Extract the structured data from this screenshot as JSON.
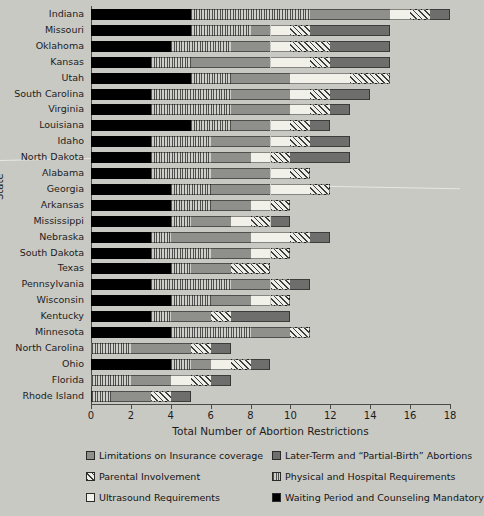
{
  "chart_data": {
    "type": "bar",
    "orientation": "horizontal",
    "stacked": true,
    "title": "",
    "xlabel": "Total Number of Abortion Restrictions",
    "ylabel": "State",
    "xlim": [
      0,
      18
    ],
    "xticks": [
      0,
      2,
      4,
      6,
      8,
      10,
      12,
      14,
      16,
      18
    ],
    "grid": false,
    "legend_position": "bottom",
    "series": [
      {
        "name": "Waiting Period and Counseling Mandatory",
        "key": "wait",
        "pattern": "solid-black",
        "color": "#000000"
      },
      {
        "name": "Physical and Hospital Requirements",
        "key": "physical",
        "pattern": "vertical-stripes",
        "color": "#b6b6b2"
      },
      {
        "name": "Limitations on Insurance coverage",
        "key": "insurance",
        "pattern": "solid-gray",
        "color": "#8f8f8b"
      },
      {
        "name": "Ultrasound Requirements",
        "key": "ultrasound",
        "pattern": "solid-white",
        "color": "#f1f1ea"
      },
      {
        "name": "Parental Involvement",
        "key": "parental",
        "pattern": "diagonal-hatch",
        "color": "#e8e8e1"
      },
      {
        "name": "Later-Term and \"Partial-Birth\" Abortions",
        "key": "later",
        "pattern": "solid-darkgray",
        "color": "#6e6e6c"
      }
    ],
    "categories": [
      "Indiana",
      "Missouri",
      "Oklahoma",
      "Kansas",
      "Utah",
      "South Carolina",
      "Virginia",
      "Louisiana",
      "Idaho",
      "North Dakota",
      "Alabama",
      "Georgia",
      "Arkansas",
      "Mississippi",
      "Nebraska",
      "South Dakota",
      "Texas",
      "Pennsylvania",
      "Wisconsin",
      "Kentucky",
      "Minnesota",
      "North Carolina",
      "Ohio",
      "Florida",
      "Rhode Island"
    ],
    "rows": [
      {
        "state": "Indiana",
        "wait": 5,
        "physical": 6,
        "insurance": 4,
        "ultrasound": 1,
        "parental": 1,
        "later": 1,
        "total": 18
      },
      {
        "state": "Missouri",
        "wait": 5,
        "physical": 3,
        "insurance": 1,
        "ultrasound": 1,
        "parental": 1,
        "later": 4,
        "total": 15
      },
      {
        "state": "Oklahoma",
        "wait": 4,
        "physical": 3,
        "insurance": 2,
        "ultrasound": 1,
        "parental": 2,
        "later": 3,
        "total": 15
      },
      {
        "state": "Kansas",
        "wait": 3,
        "physical": 2,
        "insurance": 4,
        "ultrasound": 2,
        "parental": 1,
        "later": 3,
        "total": 15
      },
      {
        "state": "Utah",
        "wait": 5,
        "physical": 2,
        "insurance": 3,
        "ultrasound": 3,
        "parental": 2,
        "later": 0,
        "total": 15
      },
      {
        "state": "South Carolina",
        "wait": 3,
        "physical": 4,
        "insurance": 3,
        "ultrasound": 1,
        "parental": 1,
        "later": 2,
        "total": 14
      },
      {
        "state": "Virginia",
        "wait": 3,
        "physical": 4,
        "insurance": 3,
        "ultrasound": 1,
        "parental": 1,
        "later": 1,
        "total": 13
      },
      {
        "state": "Louisiana",
        "wait": 5,
        "physical": 2,
        "insurance": 2,
        "ultrasound": 1,
        "parental": 1,
        "later": 1,
        "total": 12
      },
      {
        "state": "Idaho",
        "wait": 3,
        "physical": 3,
        "insurance": 3,
        "ultrasound": 1,
        "parental": 1,
        "later": 2,
        "total": 13
      },
      {
        "state": "North Dakota",
        "wait": 3,
        "physical": 3,
        "insurance": 2,
        "ultrasound": 1,
        "parental": 1,
        "later": 3,
        "total": 13
      },
      {
        "state": "Alabama",
        "wait": 3,
        "physical": 3,
        "insurance": 3,
        "ultrasound": 1,
        "parental": 1,
        "later": 0,
        "total": 11
      },
      {
        "state": "Georgia",
        "wait": 4,
        "physical": 2,
        "insurance": 3,
        "ultrasound": 2,
        "parental": 1,
        "later": 0,
        "total": 12
      },
      {
        "state": "Arkansas",
        "wait": 4,
        "physical": 2,
        "insurance": 2,
        "ultrasound": 1,
        "parental": 1,
        "later": 0,
        "total": 10
      },
      {
        "state": "Mississippi",
        "wait": 4,
        "physical": 1,
        "insurance": 2,
        "ultrasound": 1,
        "parental": 1,
        "later": 1,
        "total": 10
      },
      {
        "state": "Nebraska",
        "wait": 3,
        "physical": 1,
        "insurance": 4,
        "ultrasound": 2,
        "parental": 1,
        "later": 1,
        "total": 12
      },
      {
        "state": "South Dakota",
        "wait": 3,
        "physical": 3,
        "insurance": 2,
        "ultrasound": 1,
        "parental": 1,
        "later": 0,
        "total": 10
      },
      {
        "state": "Texas",
        "wait": 4,
        "physical": 1,
        "insurance": 2,
        "ultrasound": 0,
        "parental": 2,
        "later": 0,
        "total": 9
      },
      {
        "state": "Pennsylvania",
        "wait": 3,
        "physical": 4,
        "insurance": 2,
        "ultrasound": 0,
        "parental": 1,
        "later": 1,
        "total": 11
      },
      {
        "state": "Wisconsin",
        "wait": 4,
        "physical": 2,
        "insurance": 2,
        "ultrasound": 1,
        "parental": 1,
        "later": 0,
        "total": 10
      },
      {
        "state": "Kentucky",
        "wait": 3,
        "physical": 1,
        "insurance": 2,
        "ultrasound": 0,
        "parental": 1,
        "later": 3,
        "total": 10
      },
      {
        "state": "Minnesota",
        "wait": 4,
        "physical": 4,
        "insurance": 2,
        "ultrasound": 0,
        "parental": 1,
        "later": 0,
        "total": 11
      },
      {
        "state": "North Carolina",
        "wait": 0,
        "physical": 2,
        "insurance": 3,
        "ultrasound": 0,
        "parental": 1,
        "later": 1,
        "total": 7
      },
      {
        "state": "Ohio",
        "wait": 4,
        "physical": 1,
        "insurance": 1,
        "ultrasound": 1,
        "parental": 1,
        "later": 1,
        "total": 9
      },
      {
        "state": "Florida",
        "wait": 0,
        "physical": 2,
        "insurance": 2,
        "ultrasound": 1,
        "parental": 1,
        "later": 1,
        "total": 7
      },
      {
        "state": "Rhode Island",
        "wait": 0,
        "physical": 1,
        "insurance": 2,
        "ultrasound": 0,
        "parental": 1,
        "later": 1,
        "total": 5
      }
    ]
  },
  "axis": {
    "x_title": "Total Number of Abortion Restrictions",
    "y_title": "State",
    "x_ticks": [
      "0",
      "2",
      "4",
      "6",
      "8",
      "10",
      "12",
      "14",
      "16",
      "18"
    ]
  },
  "legend": {
    "items": [
      {
        "label": "Limitations on Insurance coverage",
        "key": "insurance"
      },
      {
        "label": "Later-Term and “Partial-Birth” Abortions",
        "key": "later"
      },
      {
        "label": "Parental Involvement",
        "key": "parental"
      },
      {
        "label": "Physical and Hospital Requirements",
        "key": "physical"
      },
      {
        "label": "Ultrasound Requirements",
        "key": "ultrasound"
      },
      {
        "label": "Waiting Period and Counseling Mandatory",
        "key": "wait"
      }
    ]
  }
}
